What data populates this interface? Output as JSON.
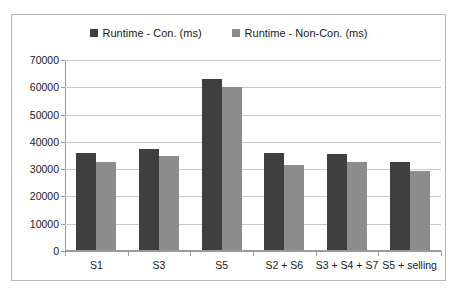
{
  "clipped_top_text": "· · ·   · ·· ·   ·   ·· ·                                                         ·· ·",
  "legend": {
    "position": "top-center",
    "entries": [
      {
        "label": "Runtime - Con. (ms)",
        "color": "#3f3f3f",
        "marker": "square-marker"
      },
      {
        "label": "Runtime - Non-Con. (ms)",
        "color": "#8c8c8c",
        "marker": "square-marker"
      }
    ]
  },
  "chart_data": {
    "type": "bar",
    "title": "",
    "xlabel": "",
    "ylabel": "",
    "ylim": [
      0,
      70000
    ],
    "ytick_step": 10000,
    "yticks": [
      70000,
      60000,
      50000,
      40000,
      30000,
      20000,
      10000,
      0
    ],
    "ytick_labels": [
      "70000",
      "60000",
      "50000",
      "40000",
      "30000",
      "20000",
      "10000",
      "0"
    ],
    "grid": true,
    "grid_axis": "y",
    "legend_position": "top-center",
    "categories": [
      "S1",
      "S3",
      "S5",
      "S2 + S6",
      "S3 + S4 + S7",
      "S5 + selling"
    ],
    "series": [
      {
        "name": "Runtime - Con. (ms)",
        "color": "#3f3f3f",
        "values": [
          35800,
          37500,
          63000,
          36000,
          35500,
          32500
        ]
      },
      {
        "name": "Runtime - Non-Con. (ms)",
        "color": "#8c8c8c",
        "values": [
          32800,
          35000,
          60000,
          31500,
          32500,
          29500
        ]
      }
    ]
  },
  "colors": {
    "series_con": "#3f3f3f",
    "series_noncon": "#8c8c8c",
    "gridline": "#c9c9c9",
    "axis": "#9a9a9a",
    "frame_border": "#b6b6ba",
    "background": "#ffffff",
    "text": "#1a1a1a"
  }
}
